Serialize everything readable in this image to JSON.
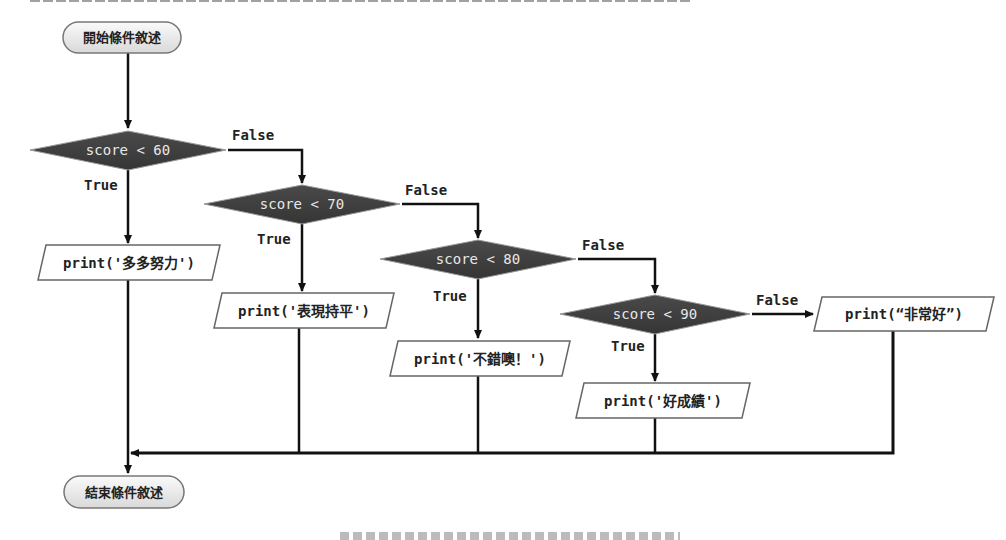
{
  "diagram": {
    "type": "flowchart",
    "start": {
      "label": "開始條件敘述"
    },
    "end": {
      "label": "結束條件敘述"
    },
    "decisions": [
      {
        "condition": "score < 60",
        "true_label": "True",
        "false_label": "False"
      },
      {
        "condition": "score < 70",
        "true_label": "True",
        "false_label": "False"
      },
      {
        "condition": "score < 80",
        "true_label": "True",
        "false_label": "False"
      },
      {
        "condition": "score < 90",
        "true_label": "True",
        "false_label": "False"
      }
    ],
    "outputs": [
      {
        "text": "print('多多努力')"
      },
      {
        "text": "print('表現持平')"
      },
      {
        "text": "print('不錯噢！')"
      },
      {
        "text": "print('好成績')"
      },
      {
        "text": "print(“非常好”)"
      }
    ],
    "colors": {
      "decision_fill": "#3f3f3f",
      "decision_text": "#e8e8e8",
      "terminal_fill": "#ececec",
      "output_fill": "#ffffff",
      "line": "#111111"
    }
  }
}
